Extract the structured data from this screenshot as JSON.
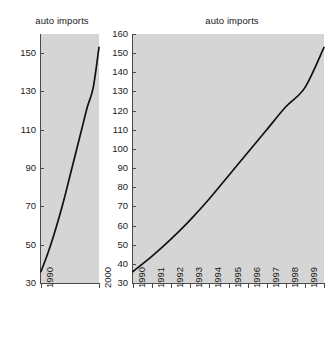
{
  "figure": {
    "background": "#ffffff",
    "plot_background": "#d5d5d5",
    "line_color": "#111111",
    "axis_color": "#4a4a4a"
  },
  "chart_data": [
    {
      "id": "left",
      "type": "line",
      "title": "auto imports",
      "xlabel": "",
      "ylabel": "",
      "x": [
        1990,
        1991,
        1992,
        1993,
        1994,
        1995,
        1996,
        1997,
        1998,
        1999,
        2000
      ],
      "values": [
        36,
        44,
        53,
        63,
        74,
        86,
        98,
        110,
        122,
        132,
        153
      ],
      "xtick_labels": [
        "1990",
        "2000"
      ],
      "xticks": [
        1990,
        2000
      ],
      "ytick_labels": [
        "30",
        "50",
        "70",
        "90",
        "110",
        "130",
        "150"
      ],
      "yticks": [
        30,
        50,
        70,
        90,
        110,
        130,
        150
      ],
      "xlim": [
        1990,
        2000
      ],
      "ylim": [
        30,
        160
      ],
      "grid": false,
      "legend": "none"
    },
    {
      "id": "right",
      "type": "line",
      "title": "auto imports",
      "xlabel": "",
      "ylabel": "",
      "x": [
        1990,
        1991,
        1992,
        1993,
        1994,
        1995,
        1996,
        1997,
        1998,
        1999,
        2000
      ],
      "values": [
        36,
        44,
        53,
        63,
        74,
        86,
        98,
        110,
        122,
        132,
        153
      ],
      "xtick_labels": [
        "1990",
        "1991",
        "1992",
        "1993",
        "1994",
        "1995",
        "1996",
        "1997",
        "1998",
        "1999",
        "2000"
      ],
      "xticks": [
        1990,
        1991,
        1992,
        1993,
        1994,
        1995,
        1996,
        1997,
        1998,
        1999,
        2000
      ],
      "ytick_labels": [
        "30",
        "40",
        "50",
        "60",
        "70",
        "80",
        "90",
        "100",
        "110",
        "120",
        "130",
        "140",
        "150",
        "160"
      ],
      "yticks": [
        30,
        40,
        50,
        60,
        70,
        80,
        90,
        100,
        110,
        120,
        130,
        140,
        150,
        160
      ],
      "xlim": [
        1990,
        2000
      ],
      "ylim": [
        30,
        160
      ],
      "grid": false,
      "legend": "none"
    }
  ]
}
